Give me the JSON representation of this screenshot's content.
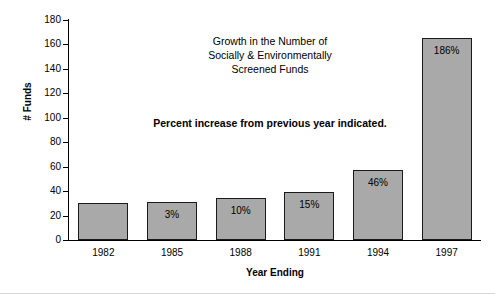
{
  "figure": {
    "background_color": "#ffffff",
    "bar_fill_color": "#a9a9a9",
    "bar_edge_color": "#1a1a1a",
    "axis_color": "#000000"
  },
  "title_lines": [
    "Growth in the Number of",
    "Socially & Environmentally",
    "Screened Funds"
  ],
  "note": "Percent increase from previous year indicated.",
  "chart_data": {
    "type": "bar",
    "title": "Growth in the Number of Socially & Environmentally Screened Funds",
    "xlabel": "Year Ending",
    "ylabel": "# Funds",
    "categories": [
      "1982",
      "1985",
      "1988",
      "1991",
      "1994",
      "1997"
    ],
    "values": [
      30,
      31,
      34,
      39,
      57,
      165
    ],
    "bar_labels": [
      "",
      "3%",
      "10%",
      "15%",
      "46%",
      "186%"
    ],
    "ylim": [
      0,
      180
    ],
    "yticks": [
      0,
      20,
      40,
      60,
      80,
      100,
      120,
      140,
      160,
      180
    ],
    "ytick_labels": [
      "0",
      "20",
      "40",
      "60",
      "80",
      "100",
      "120",
      "140",
      "160",
      "180"
    ],
    "grid": false,
    "legend": null,
    "annotations": [
      "Growth in the Number of",
      "Socially & Environmentally",
      "Screened Funds",
      "Percent increase from previous year indicated."
    ]
  }
}
